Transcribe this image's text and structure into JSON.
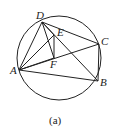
{
  "caption": "(a)",
  "circle": {
    "cx": 59,
    "cy": 58,
    "r": 42
  },
  "points": {
    "A": {
      "label": "A",
      "x": 19,
      "y": 70
    },
    "B": {
      "label": "B",
      "x": 98,
      "y": 81
    },
    "C": {
      "label": "C",
      "x": 99,
      "y": 44
    },
    "D": {
      "label": "D",
      "x": 42,
      "y": 22
    },
    "E": {
      "label": "E",
      "x": 54,
      "y": 35
    },
    "F": {
      "label": "F",
      "x": 54,
      "y": 58
    }
  },
  "segments": [
    "DA",
    "DC",
    "DE",
    "DF",
    "DB",
    "AE",
    "AF",
    "AC",
    "AB",
    "CB",
    "EF"
  ]
}
